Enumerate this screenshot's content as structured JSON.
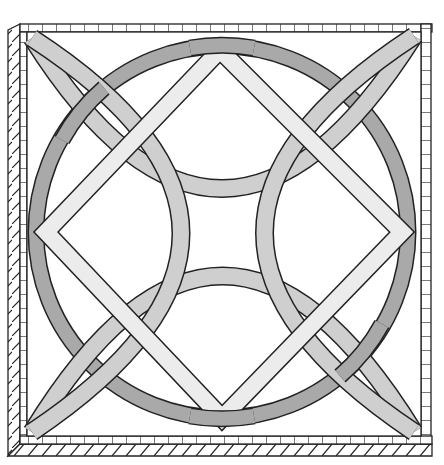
{
  "colors": {
    "background": "#ffffff",
    "outline": "#222222",
    "ring": "#a9a9a9",
    "arcs": "#cfcfcf",
    "diamond": "#ececec",
    "frame_fill": "#ffffff"
  },
  "geometry": {
    "frame_outer": [
      8,
      18,
      432,
      456
    ],
    "frame_inner": [
      27,
      28,
      420,
      440
    ],
    "ring": {
      "cx": 222,
      "cy": 232,
      "r": 186,
      "width": 15
    },
    "diamond": {
      "top": [
        220,
        50
      ],
      "right": [
        402,
        232
      ],
      "bottom": [
        222,
        418
      ],
      "left": [
        46,
        232
      ],
      "width": 17
    },
    "arc_width": 17
  }
}
